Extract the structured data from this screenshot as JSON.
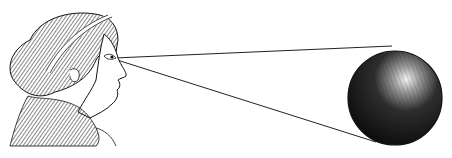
{
  "illustration": {
    "subject": "classical female head viewing a sphere",
    "elements": [
      "head",
      "eye",
      "sightline-upper",
      "sightline-lower",
      "sphere"
    ],
    "colors": {
      "ink": "#1a1a1a",
      "paper": "#ffffff",
      "highlight": "#f2f2f2"
    }
  }
}
